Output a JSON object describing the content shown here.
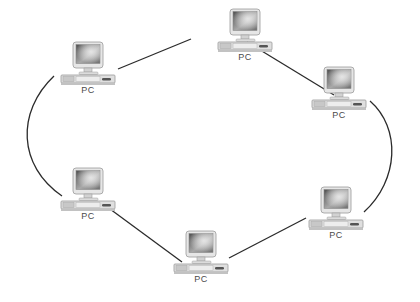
{
  "diagram": {
    "kind": "ring-network-topology",
    "background_color": "#ffffff",
    "link_color": "#2b2b2b",
    "label_color": "#4a4a4a",
    "node_icon_name": "pc-computer-icon",
    "nodes": [
      {
        "id": "pc-top",
        "label": "PC",
        "x": 214,
        "y": 8,
        "position": "top"
      },
      {
        "id": "pc-upper-left",
        "label": "PC",
        "x": 57,
        "y": 41,
        "position": "upper-left"
      },
      {
        "id": "pc-upper-right",
        "label": "PC",
        "x": 308,
        "y": 66,
        "position": "upper-right"
      },
      {
        "id": "pc-lower-left",
        "label": "PC",
        "x": 57,
        "y": 167,
        "position": "lower-left"
      },
      {
        "id": "pc-lower-right",
        "label": "PC",
        "x": 305,
        "y": 186,
        "position": "lower-right"
      },
      {
        "id": "pc-bottom",
        "label": "PC",
        "x": 170,
        "y": 230,
        "position": "bottom"
      }
    ],
    "links": [
      {
        "from": "pc-upper-left",
        "to": "pc-top",
        "shape": "line",
        "path": "M 118 69 L 191 39"
      },
      {
        "from": "pc-top",
        "to": "pc-upper-right",
        "shape": "line",
        "path": "M 247 42 L 334 95"
      },
      {
        "from": "pc-upper-right",
        "to": "pc-lower-right",
        "shape": "curve",
        "path": "M 370 101 C 401 128 399 180 364 212"
      },
      {
        "from": "pc-lower-right",
        "to": "pc-bottom",
        "shape": "line",
        "path": "M 306 218 L 229 258"
      },
      {
        "from": "pc-bottom",
        "to": "pc-lower-left",
        "shape": "line",
        "path": "M 182 262 L 110 209"
      },
      {
        "from": "pc-lower-left",
        "to": "pc-upper-left",
        "shape": "curve",
        "path": "M 62 196 C 18 166 16 112 54 76"
      }
    ]
  }
}
